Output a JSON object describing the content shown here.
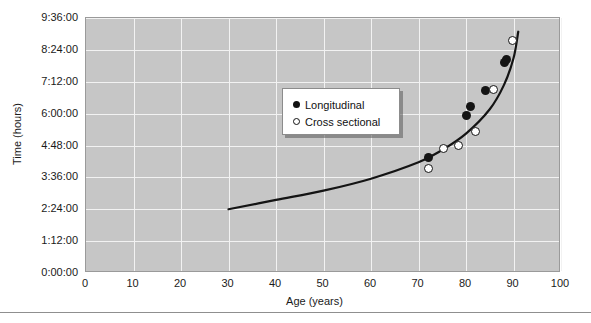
{
  "chart_data": {
    "type": "scatter",
    "title": "",
    "xlabel": "Age (years)",
    "ylabel": "Time (hours)",
    "xlim": [
      0,
      100
    ],
    "ylim": [
      "0:00:00",
      "9:36:00"
    ],
    "grid": true,
    "legend_position": "upper-left-inside",
    "xticks": [
      "0",
      "10",
      "20",
      "30",
      "40",
      "50",
      "60",
      "70",
      "80",
      "90",
      "100"
    ],
    "yticks": [
      "0:00:00",
      "1:12:00",
      "2:24:00",
      "3:36:00",
      "4:48:00",
      "6:00:00",
      "7:12:00",
      "8:24:00",
      "9:36:00"
    ],
    "series": [
      {
        "name": "Longitudinal",
        "marker": "filled-circle",
        "color": "#141414",
        "points": [
          {
            "x": 72.0,
            "y": "4:20:00"
          },
          {
            "x": 80.2,
            "y": "5:55:00"
          },
          {
            "x": 81.0,
            "y": "6:16:00"
          },
          {
            "x": 84.0,
            "y": "6:52:00"
          },
          {
            "x": 88.0,
            "y": "7:55:00"
          },
          {
            "x": 88.6,
            "y": "8:02:00"
          }
        ]
      },
      {
        "name": "Cross sectional",
        "marker": "open-circle",
        "color": "#141414",
        "points": [
          {
            "x": 72.2,
            "y": "3:55:00"
          },
          {
            "x": 75.2,
            "y": "4:42:00"
          },
          {
            "x": 78.4,
            "y": "4:48:00"
          },
          {
            "x": 82.0,
            "y": "5:20:00"
          },
          {
            "x": 85.8,
            "y": "6:55:00"
          },
          {
            "x": 89.8,
            "y": "8:45:00"
          }
        ]
      }
    ],
    "fit_curve": {
      "name": "fitted exponential trend",
      "color": "#141414",
      "x_start": 30,
      "x_end": 91,
      "points": [
        {
          "x": 30,
          "y": "2:24:00"
        },
        {
          "x": 40,
          "y": "2:45:00"
        },
        {
          "x": 50,
          "y": "3:06:00"
        },
        {
          "x": 60,
          "y": "3:33:00"
        },
        {
          "x": 70,
          "y": "4:10:00"
        },
        {
          "x": 75,
          "y": "4:38:00"
        },
        {
          "x": 80,
          "y": "5:15:00"
        },
        {
          "x": 85,
          "y": "6:10:00"
        },
        {
          "x": 88,
          "y": "7:05:00"
        },
        {
          "x": 90,
          "y": "8:05:00"
        },
        {
          "x": 91,
          "y": "9:05:00"
        }
      ]
    }
  },
  "axes": {
    "y_title": "Time (hours)",
    "x_title": "Age (years)",
    "y_ticks": [
      {
        "label": "9:36:00"
      },
      {
        "label": "8:24:00"
      },
      {
        "label": "7:12:00"
      },
      {
        "label": "6:00:00"
      },
      {
        "label": "4:48:00"
      },
      {
        "label": "3:36:00"
      },
      {
        "label": "2:24:00"
      },
      {
        "label": "1:12:00"
      },
      {
        "label": "0:00:00"
      }
    ],
    "x_ticks": [
      {
        "label": "0"
      },
      {
        "label": "10"
      },
      {
        "label": "20"
      },
      {
        "label": "30"
      },
      {
        "label": "40"
      },
      {
        "label": "50"
      },
      {
        "label": "60"
      },
      {
        "label": "70"
      },
      {
        "label": "80"
      },
      {
        "label": "90"
      },
      {
        "label": "100"
      }
    ]
  },
  "legend": {
    "entries": [
      {
        "label": "Longitudinal",
        "marker": "filled-circle"
      },
      {
        "label": "Cross sectional",
        "marker": "open-circle"
      }
    ]
  },
  "colors": {
    "plot_background": "#c6c6c6",
    "gridline": "#f2f2f2",
    "marker": "#141414",
    "curve": "#141414",
    "rule": "#8f8f8f"
  }
}
